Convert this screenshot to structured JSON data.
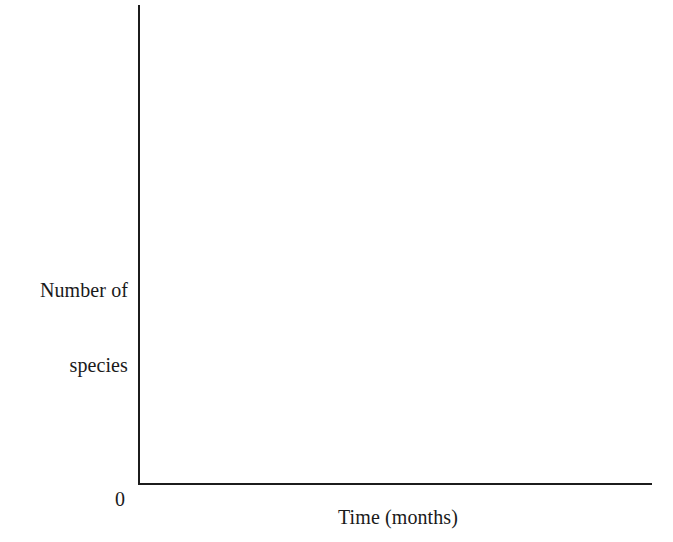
{
  "figure": {
    "background_color": "#ffffff",
    "line_color": "#1c1c1c",
    "text_color": "#1a1a1a",
    "width": 673,
    "height": 542
  },
  "axes": {
    "y_label_line1": "Number of",
    "y_label_line2": "species",
    "x_label": "Time (months)",
    "origin_label": "0"
  },
  "chart_data": {
    "type": "line",
    "title": "",
    "subtitle": "",
    "xlabel": "Time (months)",
    "ylabel": "Number of species",
    "categories": [],
    "x": [],
    "series": [],
    "values": [],
    "annotations": [
      {
        "text": "0",
        "role": "origin-tick"
      }
    ],
    "tick_labels": {
      "x": [],
      "y": [
        "0"
      ]
    },
    "xlim": [
      0,
      null
    ],
    "ylim": [
      0,
      null
    ],
    "grid": false,
    "legend": false,
    "legend_position": "none",
    "note": "Blank axes template: no plotted data series, only labelled x and y axes drawn as an open L-shaped frame."
  }
}
